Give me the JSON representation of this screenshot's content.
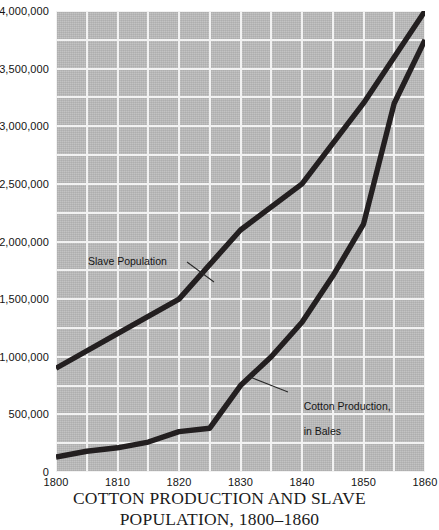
{
  "caption": {
    "line1": "COTTON PRODUCTION AND SLAVE",
    "line2": "POPULATION, 1800–1860"
  },
  "annotations": {
    "slave": "Slave Population",
    "cotton_line1": "Cotton Production,",
    "cotton_line2": "in Bales"
  },
  "chart_data": {
    "type": "line",
    "title": "COTTON PRODUCTION AND SLAVE POPULATION, 1800–1860",
    "xlabel": "",
    "ylabel": "",
    "xlim": [
      1800,
      1860
    ],
    "ylim": [
      0,
      4000000
    ],
    "grid": true,
    "x_major_step": 10,
    "x_minor_step": 5,
    "y_major_step": 500000,
    "y_minor_step": 250000,
    "legend": "annotated-labels",
    "legend_position": "in-plot",
    "x_ticks": [
      1800,
      1810,
      1820,
      1830,
      1840,
      1850,
      1860
    ],
    "x_tick_labels": [
      "1800",
      "1810",
      "1820",
      "1830",
      "1840",
      "1850",
      "1860"
    ],
    "y_ticks": [
      0,
      500000,
      1000000,
      1500000,
      2000000,
      2500000,
      3000000,
      3500000,
      4000000
    ],
    "y_tick_labels": [
      "0",
      "500,000",
      "1,000,000",
      "1,500,000",
      "2,000,000",
      "2,500,000",
      "3,000,000",
      "3,500,000",
      "4,000,000"
    ],
    "series": [
      {
        "name": "Slave Population",
        "color": "#231f20",
        "x": [
          1800,
          1810,
          1820,
          1830,
          1840,
          1850,
          1860
        ],
        "values": [
          900000,
          1200000,
          1500000,
          2100000,
          2500000,
          3200000,
          4000000
        ]
      },
      {
        "name": "Cotton Production, in Bales",
        "color": "#231f20",
        "x": [
          1800,
          1805,
          1810,
          1815,
          1820,
          1825,
          1830,
          1835,
          1840,
          1845,
          1850,
          1855,
          1860
        ],
        "values": [
          130000,
          180000,
          210000,
          260000,
          350000,
          380000,
          750000,
          1000000,
          1300000,
          1700000,
          2150000,
          3200000,
          3750000
        ]
      }
    ]
  },
  "colors": {
    "plot_background": "#bcbcbc",
    "gridline": "#f2f2f2",
    "series_stroke": "#231f20",
    "text": "#151515",
    "page_background": "#ffffff"
  }
}
